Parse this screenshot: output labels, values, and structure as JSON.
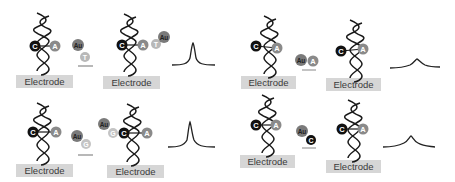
{
  "figure": {
    "type": "schematic",
    "colors": {
      "helix": "#1a1a1a",
      "electrode_fill": "#d6d6d6",
      "electrode_text": "#3a3a3a",
      "base_C": "#111111",
      "base_A": "#8a8a8a",
      "base_T": "#b8b8b8",
      "base_G": "#c4c4c4",
      "gold_label": "#7a7a7a",
      "arrow": "#9a9a9a",
      "signal": "#222222"
    },
    "panels": [
      {
        "id": "top-left",
        "outcome": "match",
        "before": {
          "electrode_label": "Electrode",
          "bases": [
            "C",
            "A"
          ]
        },
        "probe": {
          "label": "Au",
          "base": "T"
        },
        "after": {
          "electrode_label": "Electrode",
          "bases": [
            "C",
            "A",
            "T"
          ],
          "label": "Au"
        },
        "signal": "strong-peak"
      },
      {
        "id": "bottom-left",
        "outcome": "match",
        "before": {
          "electrode_label": "Electrode",
          "bases": [
            "C",
            "A"
          ]
        },
        "probe": {
          "label": "Au",
          "base": "G"
        },
        "after": {
          "electrode_label": "Electrode",
          "bases": [
            "G",
            "C",
            "A"
          ],
          "label": "Au"
        },
        "signal": "strong-peak"
      },
      {
        "id": "top-right",
        "outcome": "mismatch",
        "before": {
          "electrode_label": "Electrode",
          "bases": [
            "C",
            "A"
          ]
        },
        "probe": {
          "label": "Au",
          "base": "A"
        },
        "after": {
          "electrode_label": "Electrode",
          "bases": [
            "C",
            "A"
          ]
        },
        "signal": "weak-peak"
      },
      {
        "id": "bottom-right",
        "outcome": "mismatch",
        "before": {
          "electrode_label": "Electrode",
          "bases": [
            "C",
            "A"
          ]
        },
        "probe": {
          "label": "Au",
          "base": "C"
        },
        "after": {
          "electrode_label": "Electrode",
          "bases": [
            "C",
            "A"
          ]
        },
        "signal": "weak-peak"
      }
    ]
  },
  "labels": {
    "electrode": "Electrode",
    "au": "Au",
    "C": "C",
    "A": "A",
    "T": "T",
    "G": "G"
  }
}
